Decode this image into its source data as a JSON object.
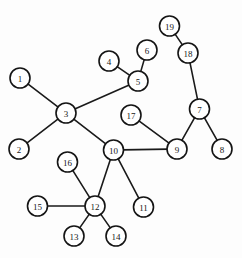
{
  "figure": {
    "background_color": "#fdfdfd",
    "width": 242,
    "height": 258
  },
  "style": {
    "node_fill": "#ffffff",
    "node_stroke": "#141414",
    "node_radius": 10,
    "edge_color": "#1a1a1a",
    "edge_width": 1.6,
    "label_color": "#181818",
    "label_font_size": 9
  },
  "graph_data": {
    "type": "node-link-diagram",
    "directed": false,
    "node_count": 19,
    "edge_count": 18,
    "nodes": [
      {
        "id": "1",
        "label": "1",
        "x": 20,
        "y": 78
      },
      {
        "id": "2",
        "label": "2",
        "x": 19,
        "y": 149
      },
      {
        "id": "3",
        "label": "3",
        "x": 66,
        "y": 113
      },
      {
        "id": "4",
        "label": "4",
        "x": 109,
        "y": 61
      },
      {
        "id": "5",
        "label": "5",
        "x": 138,
        "y": 81
      },
      {
        "id": "6",
        "label": "6",
        "x": 147,
        "y": 50
      },
      {
        "id": "7",
        "label": "7",
        "x": 199.5,
        "y": 109
      },
      {
        "id": "8",
        "label": "8",
        "x": 222,
        "y": 149
      },
      {
        "id": "9",
        "label": "9",
        "x": 177,
        "y": 149
      },
      {
        "id": "10",
        "label": "10",
        "x": 113.5,
        "y": 150
      },
      {
        "id": "11",
        "label": "11",
        "x": 143.5,
        "y": 207
      },
      {
        "id": "12",
        "label": "12",
        "x": 95,
        "y": 206
      },
      {
        "id": "13",
        "label": "13",
        "x": 74,
        "y": 236
      },
      {
        "id": "14",
        "label": "14",
        "x": 116,
        "y": 236
      },
      {
        "id": "15",
        "label": "15",
        "x": 37.5,
        "y": 206
      },
      {
        "id": "16",
        "label": "16",
        "x": 67.5,
        "y": 162
      },
      {
        "id": "17",
        "label": "17",
        "x": 131,
        "y": 115
      },
      {
        "id": "18",
        "label": "18",
        "x": 188,
        "y": 53
      },
      {
        "id": "19",
        "label": "19",
        "x": 169.5,
        "y": 26
      }
    ],
    "edges": [
      {
        "source": "1",
        "target": "3"
      },
      {
        "source": "2",
        "target": "3"
      },
      {
        "source": "3",
        "target": "5"
      },
      {
        "source": "3",
        "target": "10"
      },
      {
        "source": "4",
        "target": "5"
      },
      {
        "source": "5",
        "target": "6"
      },
      {
        "source": "19",
        "target": "18"
      },
      {
        "source": "18",
        "target": "7"
      },
      {
        "source": "7",
        "target": "8"
      },
      {
        "source": "7",
        "target": "9"
      },
      {
        "source": "17",
        "target": "9"
      },
      {
        "source": "9",
        "target": "10"
      },
      {
        "source": "10",
        "target": "11"
      },
      {
        "source": "10",
        "target": "12"
      },
      {
        "source": "12",
        "target": "13"
      },
      {
        "source": "12",
        "target": "14"
      },
      {
        "source": "12",
        "target": "15"
      },
      {
        "source": "12",
        "target": "16"
      }
    ]
  }
}
